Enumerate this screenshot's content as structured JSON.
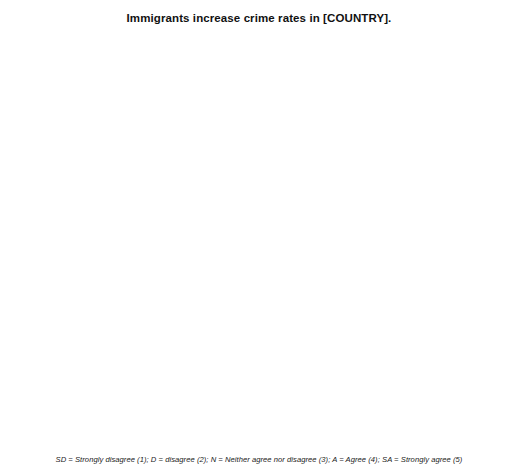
{
  "title": "Immigrants increase crime rates in [COUNTRY].",
  "footnote": "SD = Strongly disagree (1); D = disagree (2); N = Neither agree nor disagree (3); A = Agree (4); SA = Strongly agree (5)",
  "axis": {
    "ylabel": "Percent",
    "yticks": [
      20,
      40,
      60,
      80,
      100,
      120,
      140,
      160
    ],
    "ylim": [
      0,
      168
    ],
    "categories": [
      "SD",
      "D",
      "N",
      "A",
      "SA"
    ]
  },
  "colors": {
    "seg_18_34": "#b4b4b4",
    "seg_35_64": "#7d7d7d",
    "seg_65_plus": "#4f4f4f",
    "axis": "#6d6d6d",
    "text": "#1a1a1a"
  },
  "series_names": [
    "18-34",
    "35-64",
    "65+"
  ],
  "chart_data": {
    "type": "bar",
    "title": "Immigrants increase crime rates in [COUNTRY].",
    "xlabel": "",
    "ylabel": "Percent",
    "ylim": [
      0,
      168
    ],
    "yticks": [
      20,
      40,
      60,
      80,
      100,
      120,
      140,
      160
    ],
    "grid": false,
    "legend_position": "inside-top-right",
    "stacked": true,
    "categories": [
      "SD",
      "D",
      "N",
      "A",
      "SA"
    ],
    "panels": [
      {
        "name": "Australia",
        "legend": [
          {
            "label": "18-34",
            "value": "2.32"
          },
          {
            "label": "35-64",
            "value": "2.89"
          },
          {
            "label": "65+",
            "value": "3.14"
          }
        ],
        "series": [
          {
            "name": "65+",
            "values": [
              18,
              26,
              19,
              21,
              13
            ]
          },
          {
            "name": "35-64",
            "values": [
              16,
              21,
              19,
              33,
              11
            ]
          },
          {
            "name": "18-34",
            "values": [
              27,
              31,
              24,
              13,
              11
            ]
          }
        ],
        "totals": [
          61,
          78,
          62,
          67,
          35
        ]
      },
      {
        "name": "Britain",
        "legend": [
          {
            "label": "18-34",
            "value": "2.54"
          },
          {
            "label": "35-64",
            "value": "2.91"
          },
          {
            "label": "65+",
            "value": "3.31"
          }
        ],
        "series": [
          {
            "name": "65+",
            "values": [
              19,
              17,
              25,
              34,
              16
            ]
          },
          {
            "name": "35-64",
            "values": [
              14,
              12,
              21,
              29,
              15
            ]
          },
          {
            "name": "18-34",
            "values": [
              30,
              21,
              32,
              17,
              6
            ]
          }
        ],
        "totals": [
          63,
          50,
          78,
          80,
          37
        ]
      },
      {
        "name": "Canada",
        "legend": [
          {
            "label": "18-34",
            "value": "1.90"
          },
          {
            "label": "35-64",
            "value": "1.90"
          },
          {
            "label": "65+",
            "value": "1.93"
          }
        ],
        "series": [
          {
            "name": "65+",
            "values": [
              52,
              29,
              14,
              13,
              9
            ]
          },
          {
            "name": "35-64",
            "values": [
              48,
              23,
              10,
              11,
              2
            ]
          },
          {
            "name": "18-34",
            "values": [
              50,
              29,
              11,
              10,
              1
            ]
          }
        ],
        "totals": [
          150,
          81,
          35,
          34,
          12
        ]
      },
      {
        "name": "France",
        "legend": [
          {
            "label": "18-34",
            "value": "2.47"
          },
          {
            "label": "35-64",
            "value": "2.59"
          },
          {
            "label": "65+",
            "value": "2.95"
          }
        ],
        "series": [
          {
            "name": "65+",
            "values": [
              20,
              30,
              18,
              18,
              14
            ]
          },
          {
            "name": "35-64",
            "values": [
              19,
              31,
              15,
              25,
              7
            ]
          },
          {
            "name": "18-34",
            "values": [
              27,
              30,
              19,
              17,
              12
            ]
          }
        ],
        "totals": [
          66,
          91,
          52,
          60,
          33
        ]
      },
      {
        "name": "Germany",
        "legend": [
          {
            "label": "18-34",
            "value": "2.76"
          },
          {
            "label": "35-64",
            "value": "3.20"
          },
          {
            "label": "65+",
            "value": "3.60"
          }
        ],
        "series": [
          {
            "name": "65+",
            "values": [
              14,
              24,
              33,
              22,
              31
            ]
          },
          {
            "name": "35-64",
            "values": [
              7,
              8,
              30,
              21,
              20
            ]
          },
          {
            "name": "18-34",
            "values": [
              13,
              27,
              30,
              13,
              13
            ]
          }
        ],
        "totals": [
          34,
          59,
          93,
          56,
          64
        ]
      },
      {
        "name": "Italy",
        "legend": [
          {
            "label": "18-34",
            "value": "3.09"
          },
          {
            "label": "35-64",
            "value": "3.51"
          },
          {
            "label": "65+",
            "value": "3.36"
          }
        ],
        "series": [
          {
            "name": "65+",
            "values": [
              17,
              26,
              17,
              35,
              27
            ]
          },
          {
            "name": "35-64",
            "values": [
              8,
              12,
              7,
              26,
              30
            ]
          },
          {
            "name": "18-34",
            "values": [
              18,
              22,
              15,
              21,
              24
            ]
          }
        ],
        "totals": [
          43,
          60,
          39,
          82,
          81
        ]
      },
      {
        "name": "Portugal",
        "legend": [
          {
            "label": "18-34",
            "value": "2.61"
          },
          {
            "label": "35-64",
            "value": "2.83"
          },
          {
            "label": "65+",
            "value": "3.14"
          }
        ],
        "series": [
          {
            "name": "65+",
            "values": [
              9,
              21,
              26,
              28,
              12
            ]
          },
          {
            "name": "35-64",
            "values": [
              10,
              34,
              15,
              30,
              6
            ]
          },
          {
            "name": "18-34",
            "values": [
              15,
              45,
              25,
              19,
              7
            ]
          }
        ],
        "totals": [
          34,
          100,
          66,
          77,
          25
        ]
      },
      {
        "name": "Switzerland",
        "legend": [
          {
            "label": "18-34",
            "value": "3.11"
          },
          {
            "label": "35-64",
            "value": "3.40"
          },
          {
            "label": "65+",
            "value": "3.59"
          }
        ],
        "series": [
          {
            "name": "65+",
            "values": [
              12,
              15,
              21,
              35,
              31
            ]
          },
          {
            "name": "35-64",
            "values": [
              8,
              20,
              16,
              33,
              19
            ]
          },
          {
            "name": "18-34",
            "values": [
              9,
              17,
              25,
              29,
              14
            ]
          }
        ],
        "totals": [
          29,
          52,
          62,
          97,
          64
        ]
      },
      {
        "name": "United States",
        "legend": [
          {
            "label": "18-34",
            "value": "2.66"
          },
          {
            "label": "35-64",
            "value": "2.73"
          },
          {
            "label": "65+",
            "value": "2.80"
          }
        ],
        "series": [
          {
            "name": "65+",
            "values": [
              21,
              24,
              31,
              26,
              10
            ]
          },
          {
            "name": "35-64",
            "values": [
              19,
              19,
              27,
              24,
              4
            ]
          },
          {
            "name": "18-34",
            "values": [
              23,
              18,
              31,
              20,
              4
            ]
          }
        ],
        "totals": [
          63,
          61,
          89,
          70,
          18
        ]
      }
    ]
  }
}
